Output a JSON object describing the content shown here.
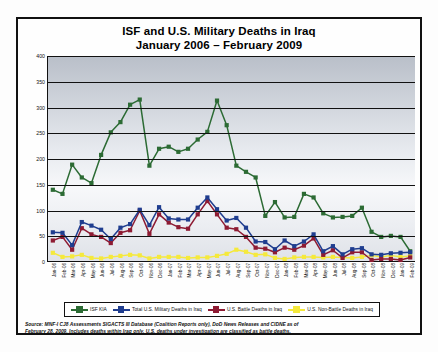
{
  "chart_data": {
    "type": "line",
    "title": "ISF and U.S. Military Deaths in Iraq",
    "subtitle": "January 2006 – February 2009",
    "xlabel": "",
    "ylabel": "",
    "ylim": [
      0,
      400
    ],
    "ytick_step": 50,
    "yticks": [
      "0",
      "50",
      "100",
      "150",
      "200",
      "250",
      "300",
      "350",
      "400"
    ],
    "grid": true,
    "legend_position": "bottom",
    "categories": [
      "Jan-06",
      "Feb-06",
      "Mar-06",
      "Apr-06",
      "May-06",
      "Jun-06",
      "Jul-06",
      "Aug-06",
      "Sep-06",
      "Oct-06",
      "Nov-06",
      "Dec-06",
      "Jan-07",
      "Feb-07",
      "Mar-07",
      "Apr-07",
      "May-07",
      "Jun-07",
      "Jul-07",
      "Aug-07",
      "Sep-07",
      "Oct-07",
      "Nov-07",
      "Dec-07",
      "Jan-08",
      "Feb-08",
      "Mar-08",
      "Apr-08",
      "May-08",
      "Jun-08",
      "Jul-08",
      "Aug-08",
      "Sep-08",
      "Oct-08",
      "Nov-08",
      "Dec-08",
      "Jan-09",
      "Feb-09"
    ],
    "series": [
      {
        "name": "ISF KIA",
        "color": "#2c6b34",
        "values": [
          139,
          131,
          188,
          163,
          152,
          207,
          251,
          271,
          305,
          315,
          186,
          219,
          223,
          213,
          219,
          237,
          252,
          313,
          265,
          186,
          174,
          163,
          88,
          115,
          85,
          86,
          131,
          124,
          93,
          85,
          86,
          88,
          104,
          57,
          47,
          49,
          47,
          19
        ]
      },
      {
        "name": "Total U.S. Military Deaths in Iraq",
        "color": "#1f3d8f",
        "values": [
          56,
          55,
          31,
          76,
          69,
          61,
          43,
          65,
          72,
          100,
          70,
          105,
          83,
          81,
          81,
          104,
          124,
          101,
          79,
          84,
          65,
          38,
          37,
          23,
          40,
          29,
          38,
          52,
          19,
          29,
          13,
          23,
          25,
          13,
          12,
          15,
          16,
          17
        ]
      },
      {
        "name": "U.S. Battle Deaths in Iraq",
        "color": "#8e1b33",
        "values": [
          40,
          47,
          22,
          64,
          52,
          47,
          35,
          55,
          60,
          98,
          53,
          91,
          75,
          66,
          63,
          91,
          117,
          91,
          65,
          62,
          47,
          26,
          24,
          17,
          26,
          22,
          30,
          44,
          12,
          21,
          6,
          17,
          17,
          2,
          4,
          4,
          2,
          7
        ]
      },
      {
        "name": "U.S. Non-Battle Deaths in Iraq",
        "color": "#f5e93c",
        "values": [
          16,
          8,
          9,
          12,
          6,
          5,
          8,
          10,
          12,
          11,
          5,
          8,
          8,
          8,
          6,
          7,
          7,
          10,
          14,
          22,
          18,
          12,
          13,
          6,
          4,
          7,
          8,
          8,
          7,
          8,
          7,
          6,
          8,
          11,
          8,
          11,
          8,
          10
        ]
      }
    ],
    "source_note_line1": "Source:  MNF-I CJ8 Assessments SIGACTS III Database (Coalition Reports only), DoD News Releases and CIDNE as of",
    "source_note_line2": "February 28, 2009.  Includes deaths within Iraq only.  U.S. deaths under investigation are classified as battle deaths."
  }
}
